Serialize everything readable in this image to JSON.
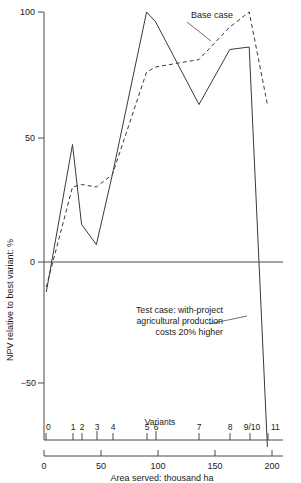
{
  "chart_data": {
    "type": "line",
    "title": "",
    "xlabel": "Area served: thousand ha",
    "ylabel": "NPV relative to best variant: %",
    "xlim": [
      0,
      210
    ],
    "ylim": [
      -75,
      100
    ],
    "grid": false,
    "legend_position": "inline-annotations",
    "x_ticks": [
      0,
      50,
      100,
      150,
      200
    ],
    "x_tick_labels": [
      "0",
      "50",
      "100",
      "150",
      "200"
    ],
    "y_ticks": [
      -50,
      0,
      50,
      100
    ],
    "y_tick_labels": [
      "−50",
      "0",
      "50",
      "100"
    ],
    "variants_axis_label": "Variants",
    "variants": [
      {
        "label": "0",
        "x": 2
      },
      {
        "label": "1",
        "x": 25
      },
      {
        "label": "2",
        "x": 33
      },
      {
        "label": "3",
        "x": 46
      },
      {
        "label": "4",
        "x": 60
      },
      {
        "label": "5",
        "x": 90
      },
      {
        "label": "6",
        "x": 98
      },
      {
        "label": "7",
        "x": 136
      },
      {
        "label": "8",
        "x": 163
      },
      {
        "label": "9/10",
        "x": 180
      },
      {
        "label": "11",
        "x": 196
      }
    ],
    "series": [
      {
        "name": "Base case",
        "style": "dashed",
        "x": [
          2,
          25,
          33,
          46,
          60,
          90,
          98,
          136,
          163,
          180,
          196
        ],
        "values": [
          -10,
          30,
          31,
          30,
          35,
          76,
          78,
          81,
          94,
          100,
          63
        ]
      },
      {
        "name": "Test case: with-project agricultural production costs 20% higher",
        "style": "solid",
        "x": [
          2,
          25,
          33,
          46,
          60,
          90,
          98,
          136,
          163,
          180,
          196
        ],
        "values": [
          -12,
          47,
          15,
          7,
          35,
          100,
          96,
          63,
          85,
          86,
          -74
        ]
      }
    ],
    "annotations": [
      {
        "name": "base-case",
        "text": "Base case",
        "text_x": 191,
        "text_y": 18,
        "leader_from": [
          187,
          22
        ],
        "leader_to": [
          211,
          41
        ]
      },
      {
        "name": "test-case",
        "lines": [
          "Test case: with-project",
          "agricultural production",
          "costs 20% higher"
        ],
        "text_x": 223,
        "text_y": 313,
        "leader_from": [
          209,
          324
        ],
        "leader_to": [
          247,
          316
        ]
      }
    ],
    "zero_reference_line": 0
  },
  "axes": {
    "y_axis_title": "NPV relative to best variant: %",
    "x_axis_title": "Area served: thousand ha",
    "variants_title": "Variants"
  },
  "colors": {
    "ink": "#1a1a1a",
    "axis": "#4a4a4a",
    "series": "#3a3a3a",
    "background": "#ffffff"
  }
}
